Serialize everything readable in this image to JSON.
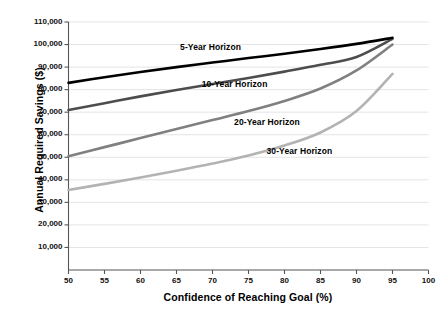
{
  "chart_data": {
    "type": "line",
    "title": "",
    "subtitle": "",
    "xlabel": "Confidence of Reaching Goal (%)",
    "ylabel": "Annual Required Savings ($)",
    "xlim": [
      50,
      100
    ],
    "ylim": [
      0,
      110000
    ],
    "xticks": [
      50,
      55,
      60,
      65,
      70,
      75,
      80,
      85,
      90,
      95,
      100
    ],
    "xticklabels": [
      "50",
      "55",
      "60",
      "65",
      "70",
      "75",
      "80",
      "85",
      "90",
      "95",
      "100"
    ],
    "yticks": [
      10000,
      20000,
      30000,
      40000,
      50000,
      60000,
      70000,
      80000,
      90000,
      100000,
      110000
    ],
    "yticklabels": [
      "10,000",
      "20,000",
      "30,000",
      "40,000",
      "50,000",
      "60,000",
      "70,000",
      "80,000",
      "90,000",
      "100,000",
      "110,000"
    ],
    "grid": "horizontal",
    "legend_position": "inline-annotations",
    "x": [
      50,
      55,
      60,
      65,
      70,
      75,
      80,
      85,
      90,
      95
    ],
    "series": [
      {
        "name": "5-Year Horizon",
        "color": "#000000",
        "linewidth": 2.6,
        "label_text": "5-Year Horizon",
        "label_x": 65.5,
        "label_y": 98500,
        "values": [
          83000,
          85500,
          87800,
          90000,
          92000,
          94000,
          95900,
          98000,
          100300,
          103000
        ]
      },
      {
        "name": "10-Year Horizon",
        "color": "#4d4d4d",
        "linewidth": 2.6,
        "label_text": "10-Year Horizon",
        "label_x": 68.5,
        "label_y": 82500,
        "values": [
          71000,
          74000,
          77000,
          79800,
          82500,
          85200,
          88000,
          91000,
          94500,
          102500
        ]
      },
      {
        "name": "20-Year Horizon",
        "color": "#808080",
        "linewidth": 2.6,
        "label_text": "20-Year Horizon",
        "label_x": 73.0,
        "label_y": 65500,
        "values": [
          50500,
          54500,
          58500,
          62500,
          66500,
          70500,
          75000,
          80500,
          88500,
          100000
        ]
      },
      {
        "name": "30-Year Horizon",
        "color": "#b3b3b3",
        "linewidth": 2.6,
        "label_text": "30-Year Horizon",
        "label_x": 77.5,
        "label_y": 52500,
        "values": [
          35500,
          38200,
          41000,
          44000,
          47200,
          50800,
          55200,
          61000,
          70500,
          87000
        ]
      }
    ]
  },
  "colors": {
    "axis": "#555555",
    "grid": "#e4e4e4",
    "text": "#000000",
    "background": "#ffffff"
  }
}
